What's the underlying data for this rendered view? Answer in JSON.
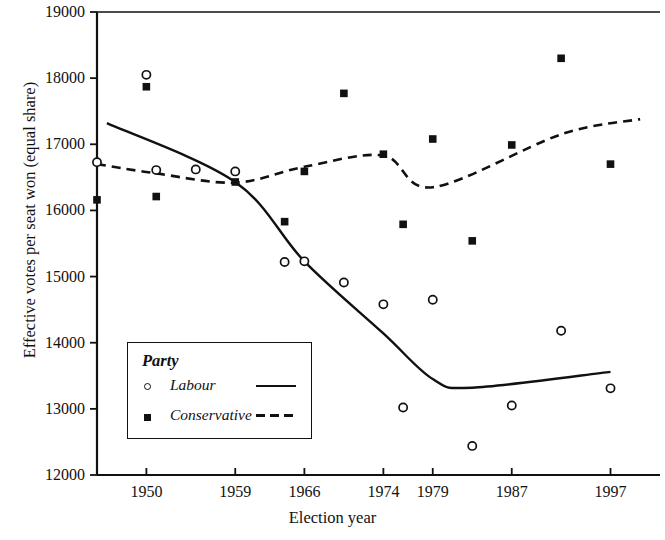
{
  "chart_data": {
    "type": "scatter",
    "title": "",
    "xlabel": "Election year",
    "ylabel": "Effective votes per seat won (equal share)",
    "xlim": [
      1945,
      2001
    ],
    "ylim": [
      12000,
      19000
    ],
    "ytick_values": [
      12000,
      13000,
      14000,
      15000,
      16000,
      17000,
      18000,
      19000
    ],
    "ytick_labels": [
      "12000",
      "13000",
      "14000",
      "15000",
      "16000",
      "17000",
      "18000",
      "19000"
    ],
    "xtick_values": [
      1950,
      1959,
      1966,
      1974,
      1979,
      1987,
      1997
    ],
    "xtick_labels": [
      "1950",
      "1959",
      "1966",
      "1974",
      "1979",
      "1987",
      "1997"
    ],
    "grid": false,
    "legend_position": "lower-left-inside",
    "legend_title": "Party",
    "series": [
      {
        "name": "Labour",
        "marker": "open-circle",
        "line_style": "solid",
        "points": [
          {
            "x": 1945,
            "y": 16730
          },
          {
            "x": 1950,
            "y": 18050
          },
          {
            "x": 1951,
            "y": 16610
          },
          {
            "x": 1955,
            "y": 16620
          },
          {
            "x": 1959,
            "y": 16590
          },
          {
            "x": 1964,
            "y": 15220
          },
          {
            "x": 1966,
            "y": 15230
          },
          {
            "x": 1970,
            "y": 14910
          },
          {
            "x": 1974,
            "y": 14580
          },
          {
            "x": 1979,
            "y": 14650
          },
          {
            "x": 1976,
            "y": 13020
          },
          {
            "x": 1983,
            "y": 12440
          },
          {
            "x": 1987,
            "y": 13050
          },
          {
            "x": 1992,
            "y": 14180
          },
          {
            "x": 1997,
            "y": 13310
          }
        ],
        "fit_line": [
          {
            "x": 1946,
            "y": 17320
          },
          {
            "x": 1959,
            "y": 16430
          },
          {
            "x": 1966,
            "y": 15230
          },
          {
            "x": 1974,
            "y": 14140
          },
          {
            "x": 1979,
            "y": 13450
          },
          {
            "x": 1983,
            "y": 13320
          },
          {
            "x": 1997,
            "y": 13560
          }
        ]
      },
      {
        "name": "Conservative",
        "marker": "filled-square",
        "line_style": "dashed",
        "points": [
          {
            "x": 1945,
            "y": 16160
          },
          {
            "x": 1950,
            "y": 17870
          },
          {
            "x": 1951,
            "y": 16210
          },
          {
            "x": 1959,
            "y": 16430
          },
          {
            "x": 1964,
            "y": 15830
          },
          {
            "x": 1966,
            "y": 16590
          },
          {
            "x": 1970,
            "y": 17770
          },
          {
            "x": 1974,
            "y": 16850
          },
          {
            "x": 1976,
            "y": 15790
          },
          {
            "x": 1979,
            "y": 17080
          },
          {
            "x": 1983,
            "y": 15540
          },
          {
            "x": 1987,
            "y": 16990
          },
          {
            "x": 1992,
            "y": 18300
          },
          {
            "x": 1997,
            "y": 16700
          }
        ],
        "fit_line": [
          {
            "x": 1945,
            "y": 16700
          },
          {
            "x": 1951,
            "y": 16560
          },
          {
            "x": 1959,
            "y": 16420
          },
          {
            "x": 1966,
            "y": 16660
          },
          {
            "x": 1974,
            "y": 16830
          },
          {
            "x": 1979,
            "y": 16350
          },
          {
            "x": 1992,
            "y": 17150
          },
          {
            "x": 2000,
            "y": 17380
          }
        ]
      }
    ]
  },
  "legend": {
    "title": "Party",
    "entries": [
      {
        "label": "Labour",
        "marker": "open-circle",
        "line": "solid"
      },
      {
        "label": "Conservative",
        "marker": "filled-square",
        "line": "dashed"
      }
    ]
  },
  "axes": {
    "x_axis_title": "Election year",
    "y_axis_title": "Effective votes per seat won (equal share)"
  }
}
